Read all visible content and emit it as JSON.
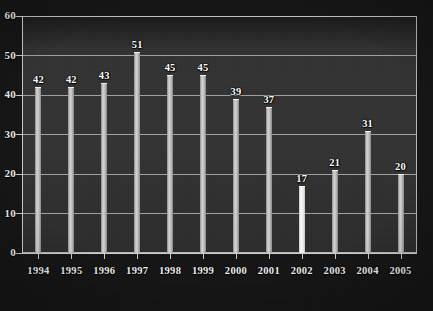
{
  "chart_data": {
    "type": "bar",
    "title": "",
    "subtitle": "",
    "xlabel": "",
    "ylabel": "",
    "categories": [
      "1994",
      "1995",
      "1996",
      "1997",
      "1998",
      "1999",
      "2000",
      "2001",
      "2002",
      "2003",
      "2004",
      "2005"
    ],
    "values": [
      42,
      42,
      43,
      51,
      45,
      45,
      39,
      37,
      17,
      21,
      31,
      20
    ],
    "data_labels": [
      "42",
      "42",
      "43",
      "51",
      "45",
      "45",
      "39",
      "37",
      "17",
      "21",
      "31",
      "20"
    ],
    "ylim": [
      0,
      60
    ],
    "ytick_values": [
      0,
      10,
      20,
      30,
      40,
      50,
      60
    ],
    "ytick_labels": [
      "0",
      "10",
      "20",
      "30",
      "40",
      "50",
      "60"
    ],
    "grid": true,
    "grid_axis": "y",
    "legend": false,
    "legend_position": "none",
    "highlighted_category": "2002",
    "series": [
      {
        "name": "",
        "values": [
          42,
          42,
          43,
          51,
          45,
          45,
          39,
          37,
          17,
          21,
          31,
          20
        ]
      }
    ]
  },
  "style": {
    "page_background": "#0c0c0c",
    "plot_background": "#313131",
    "frame_border_color": "#b9b9b9",
    "gridline_color": "#c3c3c3",
    "axis_color": "#cfcfcf",
    "bar_color": "#c6c6c6",
    "bar_highlight_color": "#f4f4f4",
    "text_color": "#f0f0f0"
  }
}
